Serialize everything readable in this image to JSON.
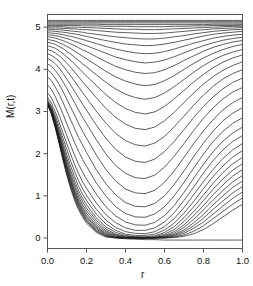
{
  "chart_data": {
    "type": "line",
    "title": "",
    "subtitle": "",
    "xlabel": "r",
    "ylabel": "M(r,t)",
    "xlim": [
      0.0,
      1.0
    ],
    "ylim": [
      -0.25,
      5.3
    ],
    "xticks": [
      0.0,
      0.2,
      0.4,
      0.6,
      0.8,
      1.0
    ],
    "xticklabels": [
      "0.0",
      "0.2",
      "0.4",
      "0.6",
      "0.8",
      "1.0"
    ],
    "yticks": [
      0,
      1,
      2,
      3,
      4,
      5
    ],
    "yticklabels": [
      "0",
      "1",
      "2",
      "3",
      "4",
      "5"
    ],
    "grid": false,
    "legend": null,
    "legend_position": "none",
    "line_color": "#1a1a1a",
    "line_width": 0.7,
    "box": true,
    "n_series": 36,
    "x": [
      0.0,
      0.02,
      0.04,
      0.06,
      0.08,
      0.1,
      0.12,
      0.14,
      0.16,
      0.18,
      0.2,
      0.25,
      0.3,
      0.35,
      0.4,
      0.45,
      0.5,
      0.55,
      0.6,
      0.65,
      0.7,
      0.75,
      0.8,
      0.85,
      0.9,
      0.95,
      1.0
    ],
    "series": [
      {
        "name": "t00",
        "values": [
          5.16,
          5.16,
          5.16,
          5.16,
          5.16,
          5.16,
          5.16,
          5.16,
          5.16,
          5.16,
          5.16,
          5.16,
          5.16,
          5.16,
          5.16,
          5.16,
          5.16,
          5.16,
          5.16,
          5.16,
          5.16,
          5.16,
          5.16,
          5.16,
          5.16,
          5.16,
          5.16
        ]
      },
      {
        "name": "t01",
        "values": [
          5.13,
          5.13,
          5.13,
          5.13,
          5.13,
          5.13,
          5.13,
          5.13,
          5.13,
          5.13,
          5.13,
          5.13,
          5.13,
          5.13,
          5.13,
          5.13,
          5.13,
          5.13,
          5.13,
          5.13,
          5.13,
          5.13,
          5.13,
          5.13,
          5.13,
          5.13,
          5.13
        ]
      },
      {
        "name": "t02",
        "values": [
          5.1,
          5.1,
          5.1,
          5.1,
          5.1,
          5.1,
          5.1,
          5.1,
          5.1,
          5.1,
          5.1,
          5.1,
          5.1,
          5.1,
          5.1,
          5.1,
          5.1,
          5.1,
          5.1,
          5.1,
          5.1,
          5.1,
          5.1,
          5.1,
          5.1,
          5.1,
          5.1
        ]
      },
      {
        "name": "t03",
        "values": [
          5.07,
          5.07,
          5.07,
          5.07,
          5.07,
          5.07,
          5.07,
          5.07,
          5.07,
          5.07,
          5.07,
          5.07,
          5.06,
          5.06,
          5.06,
          5.06,
          5.06,
          5.06,
          5.06,
          5.06,
          5.06,
          5.06,
          5.06,
          5.07,
          5.07,
          5.07,
          5.07
        ]
      },
      {
        "name": "t04",
        "values": [
          5.04,
          5.04,
          5.04,
          5.04,
          5.04,
          5.04,
          5.04,
          5.04,
          5.04,
          5.03,
          5.03,
          5.03,
          5.02,
          5.02,
          5.02,
          5.01,
          5.01,
          5.01,
          5.01,
          5.02,
          5.02,
          5.03,
          5.03,
          5.04,
          5.04,
          5.04,
          5.05
        ]
      },
      {
        "name": "t05",
        "values": [
          5.01,
          5.01,
          5.01,
          5.01,
          5.01,
          5.0,
          5.0,
          5.0,
          5.0,
          4.99,
          4.99,
          4.98,
          4.97,
          4.96,
          4.95,
          4.95,
          4.94,
          4.94,
          4.95,
          4.96,
          4.97,
          4.98,
          4.99,
          5.0,
          5.01,
          5.02,
          5.02
        ]
      },
      {
        "name": "t06",
        "values": [
          4.98,
          4.98,
          4.98,
          4.98,
          4.97,
          4.97,
          4.96,
          4.96,
          4.95,
          4.94,
          4.94,
          4.92,
          4.9,
          4.88,
          4.87,
          4.86,
          4.85,
          4.85,
          4.86,
          4.88,
          4.9,
          4.92,
          4.94,
          4.96,
          4.97,
          4.98,
          4.99
        ]
      },
      {
        "name": "t07",
        "values": [
          4.95,
          4.95,
          4.94,
          4.94,
          4.93,
          4.92,
          4.91,
          4.9,
          4.89,
          4.88,
          4.86,
          4.83,
          4.8,
          4.77,
          4.75,
          4.73,
          4.72,
          4.72,
          4.74,
          4.77,
          4.8,
          4.84,
          4.87,
          4.9,
          4.92,
          4.94,
          4.95
        ]
      },
      {
        "name": "t08",
        "values": [
          4.91,
          4.91,
          4.9,
          4.89,
          4.88,
          4.87,
          4.85,
          4.84,
          4.82,
          4.8,
          4.78,
          4.73,
          4.68,
          4.64,
          4.6,
          4.58,
          4.56,
          4.57,
          4.6,
          4.64,
          4.69,
          4.74,
          4.79,
          4.83,
          4.86,
          4.88,
          4.9
        ]
      },
      {
        "name": "t09",
        "values": [
          4.87,
          4.86,
          4.85,
          4.84,
          4.82,
          4.8,
          4.78,
          4.76,
          4.73,
          4.71,
          4.68,
          4.61,
          4.54,
          4.48,
          4.43,
          4.39,
          4.37,
          4.38,
          4.42,
          4.48,
          4.55,
          4.62,
          4.68,
          4.74,
          4.78,
          4.81,
          4.83
        ]
      },
      {
        "name": "t10",
        "values": [
          4.82,
          4.81,
          4.8,
          4.78,
          4.75,
          4.73,
          4.7,
          4.66,
          4.63,
          4.59,
          4.56,
          4.47,
          4.38,
          4.29,
          4.23,
          4.18,
          4.15,
          4.17,
          4.22,
          4.3,
          4.39,
          4.48,
          4.56,
          4.63,
          4.69,
          4.73,
          4.76
        ]
      },
      {
        "name": "t11",
        "values": [
          4.77,
          4.76,
          4.74,
          4.71,
          4.68,
          4.64,
          4.6,
          4.56,
          4.51,
          4.46,
          4.42,
          4.3,
          4.18,
          4.07,
          3.99,
          3.93,
          3.9,
          3.92,
          3.99,
          4.09,
          4.21,
          4.32,
          4.43,
          4.52,
          4.59,
          4.65,
          4.68
        ]
      },
      {
        "name": "t12",
        "values": [
          4.71,
          4.69,
          4.67,
          4.63,
          4.59,
          4.54,
          4.49,
          4.43,
          4.37,
          4.31,
          4.25,
          4.1,
          3.95,
          3.82,
          3.72,
          3.65,
          3.61,
          3.64,
          3.73,
          3.85,
          4.0,
          4.14,
          4.27,
          4.38,
          4.47,
          4.54,
          4.59
        ]
      },
      {
        "name": "t13",
        "values": [
          4.64,
          4.62,
          4.59,
          4.54,
          4.49,
          4.42,
          4.36,
          4.28,
          4.21,
          4.13,
          4.06,
          3.87,
          3.69,
          3.53,
          3.41,
          3.33,
          3.29,
          3.33,
          3.44,
          3.59,
          3.76,
          3.93,
          4.09,
          4.22,
          4.33,
          4.41,
          4.47
        ]
      },
      {
        "name": "t14",
        "values": [
          4.56,
          4.53,
          4.5,
          4.44,
          4.37,
          4.29,
          4.21,
          4.12,
          4.03,
          3.93,
          3.84,
          3.62,
          3.4,
          3.21,
          3.07,
          2.98,
          2.94,
          2.99,
          3.12,
          3.3,
          3.5,
          3.7,
          3.88,
          4.04,
          4.17,
          4.27,
          4.34
        ]
      },
      {
        "name": "t15",
        "values": [
          4.47,
          4.44,
          4.39,
          4.32,
          4.24,
          4.14,
          4.04,
          3.93,
          3.82,
          3.7,
          3.6,
          3.33,
          3.07,
          2.86,
          2.7,
          2.6,
          2.57,
          2.63,
          2.78,
          2.98,
          3.21,
          3.44,
          3.65,
          3.83,
          3.98,
          4.09,
          4.18
        ]
      },
      {
        "name": "t16",
        "values": [
          4.37,
          4.33,
          4.27,
          4.19,
          4.08,
          3.96,
          3.84,
          3.71,
          3.58,
          3.45,
          3.32,
          3.01,
          2.72,
          2.48,
          2.31,
          2.21,
          2.18,
          2.25,
          2.41,
          2.64,
          2.89,
          3.15,
          3.39,
          3.6,
          3.77,
          3.9,
          3.99
        ]
      },
      {
        "name": "t17",
        "values": [
          4.26,
          4.21,
          4.13,
          4.03,
          3.9,
          3.76,
          3.62,
          3.47,
          3.32,
          3.17,
          3.03,
          2.68,
          2.36,
          2.1,
          1.92,
          1.82,
          1.79,
          1.87,
          2.05,
          2.29,
          2.57,
          2.86,
          3.12,
          3.35,
          3.54,
          3.69,
          3.79
        ]
      },
      {
        "name": "t18",
        "values": [
          4.13,
          4.07,
          3.97,
          3.85,
          3.7,
          3.54,
          3.37,
          3.2,
          3.03,
          2.86,
          2.71,
          2.33,
          1.99,
          1.72,
          1.53,
          1.43,
          1.41,
          1.49,
          1.68,
          1.94,
          2.24,
          2.55,
          2.84,
          3.09,
          3.3,
          3.46,
          3.57
        ]
      },
      {
        "name": "t19",
        "values": [
          3.99,
          3.91,
          3.79,
          3.64,
          3.47,
          3.28,
          3.09,
          2.9,
          2.71,
          2.53,
          2.37,
          1.97,
          1.62,
          1.35,
          1.16,
          1.07,
          1.05,
          1.13,
          1.32,
          1.59,
          1.91,
          2.24,
          2.54,
          2.81,
          3.04,
          3.21,
          3.33
        ]
      },
      {
        "name": "t20",
        "values": [
          3.82,
          3.73,
          3.58,
          3.41,
          3.21,
          3.0,
          2.79,
          2.58,
          2.38,
          2.2,
          2.03,
          1.62,
          1.28,
          1.02,
          0.84,
          0.75,
          0.74,
          0.82,
          1.0,
          1.27,
          1.59,
          1.93,
          2.25,
          2.54,
          2.78,
          2.96,
          3.09
        ]
      },
      {
        "name": "t21",
        "values": [
          3.63,
          3.52,
          3.35,
          3.15,
          2.93,
          2.7,
          2.47,
          2.25,
          2.05,
          1.86,
          1.7,
          1.31,
          0.99,
          0.74,
          0.58,
          0.5,
          0.49,
          0.57,
          0.74,
          1.0,
          1.32,
          1.66,
          1.99,
          2.29,
          2.53,
          2.72,
          2.85
        ]
      },
      {
        "name": "t22",
        "values": [
          3.45,
          3.32,
          3.13,
          2.91,
          2.66,
          2.42,
          2.18,
          1.95,
          1.74,
          1.56,
          1.4,
          1.04,
          0.74,
          0.52,
          0.38,
          0.31,
          0.3,
          0.37,
          0.53,
          0.77,
          1.08,
          1.42,
          1.75,
          2.05,
          2.3,
          2.49,
          2.63
        ]
      },
      {
        "name": "t23",
        "values": [
          3.34,
          3.2,
          2.99,
          2.74,
          2.48,
          2.22,
          1.97,
          1.73,
          1.52,
          1.33,
          1.18,
          0.83,
          0.55,
          0.36,
          0.24,
          0.18,
          0.18,
          0.24,
          0.38,
          0.6,
          0.89,
          1.21,
          1.54,
          1.84,
          2.09,
          2.29,
          2.43
        ]
      },
      {
        "name": "t24",
        "values": [
          3.28,
          3.13,
          2.9,
          2.64,
          2.36,
          2.08,
          1.81,
          1.57,
          1.35,
          1.17,
          1.01,
          0.68,
          0.42,
          0.25,
          0.15,
          0.11,
          0.1,
          0.15,
          0.27,
          0.46,
          0.72,
          1.03,
          1.34,
          1.63,
          1.89,
          2.09,
          2.24
        ]
      },
      {
        "name": "t25",
        "values": [
          3.25,
          3.09,
          2.84,
          2.56,
          2.26,
          1.96,
          1.69,
          1.44,
          1.22,
          1.04,
          0.89,
          0.57,
          0.33,
          0.18,
          0.09,
          0.06,
          0.06,
          0.09,
          0.19,
          0.35,
          0.59,
          0.87,
          1.17,
          1.46,
          1.71,
          1.92,
          2.07
        ]
      },
      {
        "name": "t26",
        "values": [
          3.23,
          3.06,
          2.8,
          2.5,
          2.18,
          1.87,
          1.59,
          1.34,
          1.12,
          0.94,
          0.79,
          0.48,
          0.26,
          0.13,
          0.06,
          0.03,
          0.03,
          0.05,
          0.13,
          0.27,
          0.48,
          0.74,
          1.02,
          1.3,
          1.55,
          1.76,
          1.91
        ]
      },
      {
        "name": "t27",
        "values": [
          3.22,
          3.04,
          2.76,
          2.45,
          2.12,
          1.8,
          1.51,
          1.26,
          1.04,
          0.86,
          0.71,
          0.42,
          0.21,
          0.09,
          0.04,
          0.02,
          0.01,
          0.03,
          0.09,
          0.2,
          0.39,
          0.63,
          0.89,
          1.16,
          1.4,
          1.61,
          1.76
        ]
      },
      {
        "name": "t28",
        "values": [
          3.21,
          3.02,
          2.73,
          2.41,
          2.07,
          1.74,
          1.45,
          1.19,
          0.97,
          0.79,
          0.64,
          0.36,
          0.17,
          0.07,
          0.02,
          0.01,
          0.0,
          0.01,
          0.06,
          0.15,
          0.31,
          0.53,
          0.77,
          1.03,
          1.26,
          1.47,
          1.62
        ]
      },
      {
        "name": "t29",
        "values": [
          3.2,
          3.01,
          2.71,
          2.38,
          2.02,
          1.69,
          1.39,
          1.13,
          0.91,
          0.73,
          0.58,
          0.31,
          0.14,
          0.05,
          0.01,
          0.0,
          0.0,
          0.01,
          0.04,
          0.11,
          0.25,
          0.44,
          0.67,
          0.9,
          1.13,
          1.33,
          1.48
        ]
      },
      {
        "name": "t30",
        "values": [
          3.19,
          3.0,
          2.69,
          2.35,
          1.99,
          1.65,
          1.35,
          1.08,
          0.86,
          0.68,
          0.53,
          0.27,
          0.11,
          0.04,
          0.01,
          0.0,
          0.0,
          0.0,
          0.03,
          0.08,
          0.19,
          0.36,
          0.56,
          0.79,
          1.0,
          1.2,
          1.35
        ]
      },
      {
        "name": "t31",
        "values": [
          3.18,
          2.98,
          2.67,
          2.32,
          1.95,
          1.61,
          1.31,
          1.04,
          0.82,
          0.64,
          0.49,
          0.24,
          0.09,
          0.02,
          0.0,
          0.0,
          0.0,
          0.0,
          0.02,
          0.06,
          0.15,
          0.29,
          0.47,
          0.68,
          0.88,
          1.07,
          1.22
        ]
      },
      {
        "name": "t32",
        "values": [
          3.18,
          2.97,
          2.65,
          2.3,
          1.92,
          1.57,
          1.27,
          1.0,
          0.78,
          0.6,
          0.45,
          0.21,
          0.07,
          0.01,
          0.0,
          0.0,
          0.0,
          0.0,
          0.01,
          0.04,
          0.11,
          0.23,
          0.38,
          0.57,
          0.76,
          0.94,
          1.09
        ]
      },
      {
        "name": "t33",
        "values": [
          3.17,
          2.96,
          2.64,
          2.27,
          1.89,
          1.54,
          1.23,
          0.96,
          0.74,
          0.57,
          0.42,
          0.18,
          0.05,
          0.01,
          0.0,
          0.0,
          0.0,
          0.0,
          0.0,
          0.02,
          0.07,
          0.16,
          0.29,
          0.46,
          0.63,
          0.8,
          0.95
        ]
      },
      {
        "name": "t34",
        "values": [
          3.17,
          2.95,
          2.62,
          2.25,
          1.86,
          1.5,
          1.19,
          0.92,
          0.7,
          0.53,
          0.39,
          0.16,
          0.04,
          0.0,
          0.0,
          0.0,
          0.0,
          0.0,
          0.0,
          0.01,
          0.04,
          0.1,
          0.2,
          0.34,
          0.5,
          0.66,
          0.8
        ]
      },
      {
        "name": "t35",
        "values": [
          3.16,
          2.94,
          2.61,
          2.23,
          1.83,
          1.47,
          1.15,
          0.88,
          0.66,
          0.49,
          0.35,
          0.13,
          0.02,
          0.0,
          -0.02,
          -0.03,
          -0.04,
          -0.04,
          -0.05,
          -0.05,
          -0.05,
          -0.05,
          -0.05,
          -0.05,
          -0.05,
          -0.05,
          -0.05
        ]
      }
    ]
  }
}
